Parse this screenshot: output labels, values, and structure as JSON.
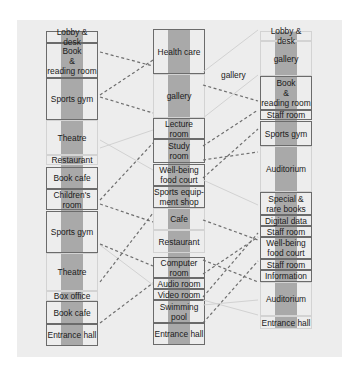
{
  "diagram": {
    "title": "",
    "colors": {
      "panel": "#ededed",
      "spine": "#a9a9a9",
      "border": "#6b6b6b",
      "dashed": "#6e6e6e",
      "faint_line": "#d0d0d0"
    },
    "columns": [
      {
        "id": "left",
        "blocks": [
          {
            "label": "Lobby & desk",
            "top": 11,
            "height": 12,
            "style": "framed"
          },
          {
            "label": "Book & reading room",
            "top": 23,
            "height": 35,
            "style": "framed"
          },
          {
            "label": "Sports gym",
            "top": 58,
            "height": 42,
            "style": "framed"
          },
          {
            "label": "Theatre",
            "top": 100,
            "height": 35,
            "style": "faint"
          },
          {
            "label": "Restaurant",
            "top": 135,
            "height": 10,
            "style": "faint"
          },
          {
            "label": "Book cafe",
            "top": 147,
            "height": 22,
            "style": "framed"
          },
          {
            "label": "Children's room",
            "top": 169,
            "height": 21,
            "style": "framed"
          },
          {
            "label": "Sports gym",
            "top": 191,
            "height": 42,
            "style": "framed"
          },
          {
            "label": "Theatre",
            "top": 233,
            "height": 38,
            "style": "faint"
          },
          {
            "label": "Box office",
            "top": 271,
            "height": 10,
            "style": "faint"
          },
          {
            "label": "Book cafe",
            "top": 281,
            "height": 23,
            "style": "framed"
          },
          {
            "label": "Entrance hall",
            "top": 304,
            "height": 22,
            "style": "framed"
          }
        ]
      },
      {
        "id": "middle",
        "blocks": [
          {
            "label": "Health care",
            "top": 9,
            "height": 45,
            "style": "framed"
          },
          {
            "label": "gallery",
            "top": 54,
            "height": 44,
            "style": "faint"
          },
          {
            "label": "Lecture room",
            "top": 98,
            "height": 21,
            "style": "framed"
          },
          {
            "label": "Study room",
            "top": 119,
            "height": 24,
            "style": "framed"
          },
          {
            "label": "Well-being food court",
            "top": 144,
            "height": 22,
            "style": "framed"
          },
          {
            "label": "Sports equip-ment shop",
            "top": 166,
            "height": 22,
            "style": "framed"
          },
          {
            "label": "Cafe",
            "top": 188,
            "height": 22,
            "style": "faint"
          },
          {
            "label": "Restaurant",
            "top": 210,
            "height": 23,
            "style": "faint"
          },
          {
            "label": "Computer room",
            "top": 237,
            "height": 21,
            "style": "framed"
          },
          {
            "label": "Audio room",
            "top": 258,
            "height": 11,
            "style": "framed"
          },
          {
            "label": "Video room",
            "top": 269,
            "height": 11,
            "style": "framed"
          },
          {
            "label": "Swimming pool",
            "top": 280,
            "height": 23,
            "style": "framed"
          },
          {
            "label": "Entrance hall",
            "top": 303,
            "height": 22,
            "style": "framed"
          }
        ]
      },
      {
        "id": "right",
        "blocks": [
          {
            "label": "Lobby & desk",
            "top": 11,
            "height": 10,
            "style": "faint"
          },
          {
            "label": "gallery",
            "top": 21,
            "height": 35,
            "style": "faint"
          },
          {
            "label": "Book & reading room",
            "top": 56,
            "height": 34,
            "style": "framed"
          },
          {
            "label": "Staff room",
            "top": 90,
            "height": 10,
            "style": "framed"
          },
          {
            "label": "Sports gym",
            "top": 101,
            "height": 25,
            "style": "framed"
          },
          {
            "label": "Auditorium",
            "top": 126,
            "height": 46,
            "style": "faint"
          },
          {
            "label": "Special & rare books",
            "top": 172,
            "height": 23,
            "style": "framed"
          },
          {
            "label": "Digital data",
            "top": 195,
            "height": 11,
            "style": "framed"
          },
          {
            "label": "Staff room",
            "top": 206,
            "height": 11,
            "style": "framed"
          },
          {
            "label": "Well-being food court",
            "top": 217,
            "height": 22,
            "style": "framed"
          },
          {
            "label": "Staff room",
            "top": 239,
            "height": 11,
            "style": "framed"
          },
          {
            "label": "Information",
            "top": 250,
            "height": 12,
            "style": "framed"
          },
          {
            "label": "Auditorium",
            "top": 262,
            "height": 34,
            "style": "faint"
          },
          {
            "label": "Entrance hall",
            "top": 296,
            "height": 13,
            "style": "faint"
          }
        ]
      }
    ],
    "floating_labels": [
      {
        "label": "gallery",
        "x": 221,
        "y": 69
      }
    ],
    "connections_dashed": [
      {
        "from": "Book & reading room (left)",
        "to": "Health care"
      },
      {
        "from": "Sports gym (left)",
        "to": "Health care"
      },
      {
        "from": "Sports gym (left)",
        "to": "gallery (middle)"
      },
      {
        "from": "Book cafe (left)",
        "to": "Lecture room"
      },
      {
        "from": "Children's room",
        "to": "Sports equip-ment shop"
      },
      {
        "from": "Sports gym (left, lower)",
        "to": "Well-being food court (middle)"
      },
      {
        "from": "Sports gym (left, lower)",
        "to": "Restaurant (middle)"
      },
      {
        "from": "Book cafe (left, lower)",
        "to": "Audio room"
      },
      {
        "from": "gallery (middle)",
        "to": "Book & reading room (right)"
      },
      {
        "from": "Lecture room",
        "to": "Sports gym (right)"
      },
      {
        "from": "Study room",
        "to": "Book & reading room (right)"
      },
      {
        "from": "Sports equip-ment shop",
        "to": "Sports gym (right)"
      },
      {
        "from": "Cafe",
        "to": "Special & rare books"
      },
      {
        "from": "Computer room",
        "to": "Well-being food court (right)"
      },
      {
        "from": "Swimming pool",
        "to": "Staff room (right)"
      }
    ]
  }
}
